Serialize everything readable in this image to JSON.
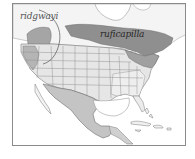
{
  "map": {
    "type": "species range map",
    "region": "North America",
    "labels": {
      "ridgwayi": "ridgwayi",
      "ruficapilla": "ruficapilla"
    },
    "colors": {
      "breeding": "#8f8f8f",
      "breeding_light": "#b5b5b5",
      "migration": "#dcdcdc",
      "wintering": "#c4c4c4",
      "land": "#f2f2f2",
      "water": "#ffffff",
      "border": "#7a7a7a",
      "frame": "#8a8a8a"
    }
  }
}
